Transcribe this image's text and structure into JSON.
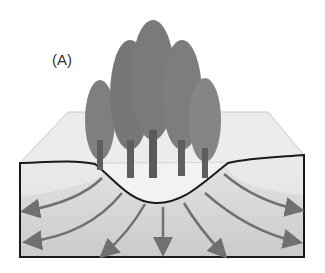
{
  "figure": {
    "label": "(A)",
    "colors": {
      "tree_foliage": "#7a7a7a",
      "trunk": "#5e5e5e",
      "surface": "#ececec",
      "soil_upper": "#e2e2e2",
      "soil_lower": "#cfcfcf",
      "arrows": "#707070",
      "outline": "#1a1a1a"
    },
    "arrow_count": 9,
    "tree_count": 5
  }
}
